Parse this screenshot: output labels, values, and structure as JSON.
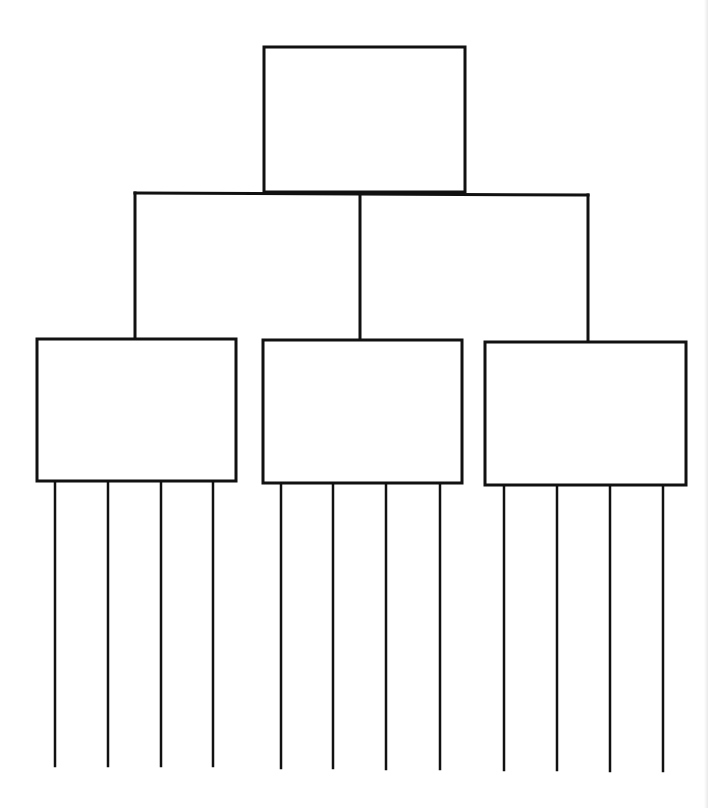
{
  "diagram": {
    "type": "tree-organizer",
    "stroke_color": "#111111",
    "background": "#ffffff",
    "root": {
      "label": "",
      "box": {
        "x": 264,
        "y": 47,
        "w": 201,
        "h": 145
      }
    },
    "connector": {
      "bar": {
        "x1": 135,
        "y1": 193,
        "x2": 588,
        "y2": 195
      },
      "drops": [
        {
          "x": 135,
          "y1": 193,
          "y2": 339
        },
        {
          "x": 360,
          "y1": 194,
          "y2": 340
        },
        {
          "x": 588,
          "y1": 195,
          "y2": 342
        }
      ]
    },
    "children": [
      {
        "label": "",
        "box": {
          "x": 37,
          "y": 339,
          "w": 199,
          "h": 142
        },
        "legs": [
          {
            "x": 55,
            "y1": 481,
            "y2": 766,
            "label": ""
          },
          {
            "x": 108,
            "y1": 481,
            "y2": 766,
            "label": ""
          },
          {
            "x": 161,
            "y1": 481,
            "y2": 766,
            "label": ""
          },
          {
            "x": 213,
            "y1": 481,
            "y2": 766,
            "label": ""
          }
        ]
      },
      {
        "label": "",
        "box": {
          "x": 263,
          "y": 340,
          "w": 199,
          "h": 143
        },
        "legs": [
          {
            "x": 281,
            "y1": 483,
            "y2": 768,
            "label": ""
          },
          {
            "x": 333,
            "y1": 483,
            "y2": 768,
            "label": ""
          },
          {
            "x": 386,
            "y1": 483,
            "y2": 769,
            "label": ""
          },
          {
            "x": 440,
            "y1": 483,
            "y2": 769,
            "label": ""
          }
        ]
      },
      {
        "label": "",
        "box": {
          "x": 485,
          "y": 342,
          "w": 201,
          "h": 143
        },
        "legs": [
          {
            "x": 504,
            "y1": 485,
            "y2": 770,
            "label": ""
          },
          {
            "x": 557,
            "y1": 485,
            "y2": 770,
            "label": ""
          },
          {
            "x": 610,
            "y1": 485,
            "y2": 771,
            "label": ""
          },
          {
            "x": 663,
            "y1": 485,
            "y2": 771,
            "label": ""
          }
        ]
      }
    ]
  }
}
